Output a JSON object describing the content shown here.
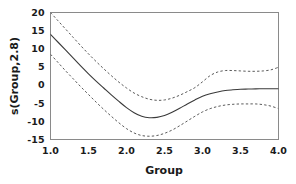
{
  "chart_data": {
    "type": "line",
    "title": "",
    "subtitle": "",
    "xlabel": "Group",
    "ylabel": "s(Group,2.8)",
    "xlim": [
      1.0,
      4.0
    ],
    "ylim": [
      -15,
      20
    ],
    "grid": false,
    "legend": null,
    "xticks": [
      "1.0",
      "1.5",
      "2.0",
      "2.5",
      "3.0",
      "3.5",
      "4.0"
    ],
    "xtick_values": [
      1.0,
      1.5,
      2.0,
      2.5,
      3.0,
      3.5,
      4.0
    ],
    "yticks": [
      "20",
      "15",
      "10",
      "5",
      "0",
      "-5",
      "-10",
      "-15"
    ],
    "ytick_values": [
      20,
      15,
      10,
      5,
      0,
      -5,
      -10,
      -15
    ],
    "x": [
      1.0,
      1.1,
      1.2,
      1.3,
      1.4,
      1.5,
      1.6,
      1.7,
      1.8,
      1.9,
      2.0,
      2.1,
      2.2,
      2.3,
      2.4,
      2.5,
      2.6,
      2.7,
      2.8,
      2.9,
      3.0,
      3.1,
      3.2,
      3.3,
      3.4,
      3.5,
      3.6,
      3.7,
      3.8,
      3.9,
      4.0
    ],
    "series": [
      {
        "name": "fit",
        "style": "solid",
        "color": "#3a3a3a",
        "values": [
          14.0,
          11.8,
          9.6,
          7.4,
          5.2,
          3.1,
          1.1,
          -0.8,
          -2.7,
          -4.5,
          -6.2,
          -7.6,
          -8.6,
          -9.0,
          -8.9,
          -8.4,
          -7.5,
          -6.4,
          -5.2,
          -4.1,
          -3.1,
          -2.4,
          -1.9,
          -1.5,
          -1.3,
          -1.15,
          -1.1,
          -1.05,
          -1.02,
          -1.0,
          -1.0
        ]
      },
      {
        "name": "upper-confidence-band",
        "style": "dashed",
        "color": "#5a5a5a",
        "values": [
          20.0,
          17.7,
          15.4,
          13.1,
          10.8,
          8.6,
          6.5,
          4.5,
          2.6,
          0.8,
          -0.8,
          -2.2,
          -3.2,
          -3.9,
          -4.2,
          -4.1,
          -3.6,
          -2.8,
          -1.8,
          -0.7,
          0.9,
          2.6,
          3.6,
          4.0,
          4.0,
          3.9,
          3.8,
          3.8,
          3.9,
          4.2,
          4.9
        ]
      },
      {
        "name": "lower-confidence-band",
        "style": "dashed",
        "color": "#5a5a5a",
        "values": [
          8.5,
          6.2,
          3.9,
          1.7,
          -0.5,
          -2.6,
          -4.7,
          -6.7,
          -8.6,
          -10.4,
          -12.0,
          -13.2,
          -13.9,
          -14.1,
          -13.9,
          -13.3,
          -12.4,
          -11.2,
          -9.9,
          -8.6,
          -7.4,
          -6.5,
          -5.9,
          -5.5,
          -5.3,
          -5.2,
          -5.2,
          -5.2,
          -5.4,
          -5.8,
          -6.5
        ]
      }
    ],
    "annotations": []
  }
}
